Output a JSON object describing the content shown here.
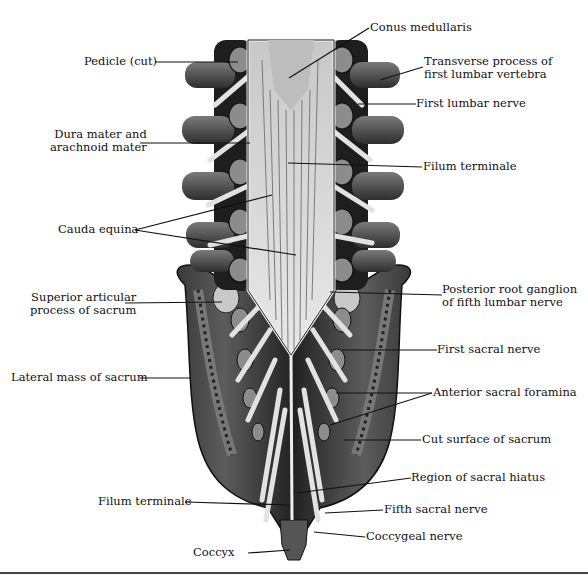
{
  "figure": {
    "labels_left": [
      {
        "id": "pedicle",
        "text": "Pedicle (cut)"
      },
      {
        "id": "dura",
        "line1": "Dura mater and",
        "line2": "arachnoid mater"
      },
      {
        "id": "cauda",
        "text": "Cauda equina"
      },
      {
        "id": "sup_art",
        "line1": "Superior articular",
        "line2": "process of sacrum"
      },
      {
        "id": "lat_mass",
        "text": "Lateral mass of sacrum"
      },
      {
        "id": "filum2",
        "text": "Filum terminale"
      },
      {
        "id": "coccyx",
        "text": "Coccyx"
      }
    ],
    "labels_right": [
      {
        "id": "conus",
        "text": "Conus medullaris"
      },
      {
        "id": "transverse",
        "line1": "Transverse process of",
        "line2": "first lumbar vertebra"
      },
      {
        "id": "first_lumbar",
        "text": "First lumbar nerve"
      },
      {
        "id": "filum1",
        "text": "Filum terminale"
      },
      {
        "id": "post_root",
        "line1": "Posterior root ganglion",
        "line2": "of fifth lumbar nerve"
      },
      {
        "id": "first_sacral",
        "text": "First sacral nerve"
      },
      {
        "id": "ant_foramina",
        "text": "Anterior sacral foramina"
      },
      {
        "id": "cut_surface",
        "text": "Cut surface of sacrum"
      },
      {
        "id": "sacral_hiatus",
        "text": "Region of sacral hiatus"
      },
      {
        "id": "fifth_sacral",
        "text": "Fifth sacral nerve"
      },
      {
        "id": "coccygeal",
        "text": "Coccygeal nerve"
      }
    ]
  },
  "colors": {
    "bone_dark": "#2a2a2a",
    "bone_mid": "#5a5a5a",
    "bone_light": "#8a8a8a",
    "nerve": "#e6e6e6",
    "cord": "#cfcfcf",
    "line": "#111111"
  }
}
